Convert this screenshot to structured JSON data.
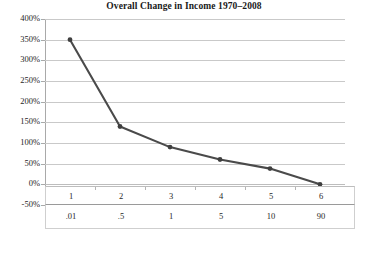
{
  "chart_data": {
    "type": "line",
    "title": "Overall Change in Income 1970–2008",
    "xlabel": "",
    "ylabel": "",
    "grid": true,
    "legend": false,
    "categories": [
      "1",
      "2",
      "3",
      "4",
      "5",
      "6"
    ],
    "x_sublabels": [
      ".01",
      ".5",
      "1",
      "5",
      "10",
      "90"
    ],
    "values": [
      350,
      140,
      90,
      60,
      38,
      0
    ],
    "value_labels": [
      "350%",
      "140%",
      "90%",
      "60%",
      "38%",
      "0%"
    ],
    "ylim": [
      -50,
      400
    ],
    "ytick_values": [
      400,
      350,
      300,
      250,
      200,
      150,
      100,
      50,
      0,
      -50
    ],
    "ytick_labels": [
      "400%",
      "350%",
      "300%",
      "250%",
      "200%",
      "150%",
      "100%",
      "50%",
      "0%",
      "-50%"
    ],
    "series": [
      {
        "name": "Overall Change in Income",
        "values": [
          350,
          140,
          90,
          60,
          38,
          0
        ]
      }
    ],
    "colors": {
      "line": "#4a4a4a",
      "marker": "#3f3f3f",
      "gridline": "#c9c9c9",
      "axis": "#a9a9a9",
      "text": "#1f1f1f",
      "background": "#ffffff"
    }
  }
}
